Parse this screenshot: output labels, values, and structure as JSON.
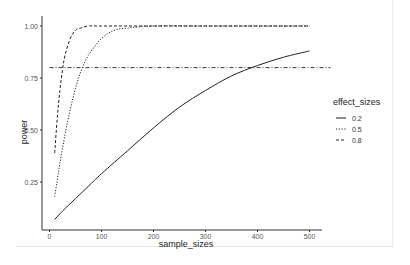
{
  "chart_data": {
    "type": "line",
    "title": "",
    "xlabel": "sample_sizes",
    "ylabel": "power",
    "xlim": [
      0,
      520
    ],
    "ylim": [
      0.03,
      1.05
    ],
    "x_ticks": [
      0,
      100,
      200,
      300,
      400,
      500
    ],
    "x_tick_labels": [
      "0",
      "100",
      "200",
      "300",
      "400",
      "500"
    ],
    "y_ticks": [
      0.25,
      0.5,
      0.75,
      1.0
    ],
    "y_tick_labels": [
      "0.25",
      "0.50",
      "0.75",
      "1.00"
    ],
    "grid": false,
    "legend": {
      "title": "effect_sizes",
      "position": "right",
      "entries": [
        "0.2",
        "0.5",
        "0.8"
      ]
    },
    "series": [
      {
        "name": "0.2",
        "linetype": "solid",
        "x": [
          10,
          25,
          50,
          75,
          100,
          150,
          200,
          250,
          300,
          350,
          400,
          450,
          500
        ],
        "y": [
          0.07,
          0.11,
          0.17,
          0.23,
          0.29,
          0.4,
          0.51,
          0.61,
          0.69,
          0.76,
          0.81,
          0.85,
          0.88
        ]
      },
      {
        "name": "0.5",
        "linetype": "dotted",
        "x": [
          10,
          15,
          20,
          30,
          40,
          50,
          60,
          75,
          100,
          125,
          150,
          200,
          300,
          400,
          500
        ],
        "y": [
          0.18,
          0.26,
          0.34,
          0.48,
          0.6,
          0.7,
          0.78,
          0.86,
          0.94,
          0.98,
          0.99,
          1.0,
          1.0,
          1.0,
          1.0
        ]
      },
      {
        "name": "0.8",
        "linetype": "dashed",
        "x": [
          10,
          15,
          20,
          25,
          30,
          40,
          50,
          60,
          75,
          100,
          200,
          300,
          400,
          500
        ],
        "y": [
          0.39,
          0.56,
          0.69,
          0.79,
          0.86,
          0.94,
          0.98,
          0.99,
          1.0,
          1.0,
          1.0,
          1.0,
          1.0,
          1.0
        ]
      }
    ],
    "reference_lines": [
      {
        "orientation": "horizontal",
        "y": 0.8,
        "linetype": "dotdash",
        "x_range": [
          0,
          525
        ]
      }
    ]
  }
}
